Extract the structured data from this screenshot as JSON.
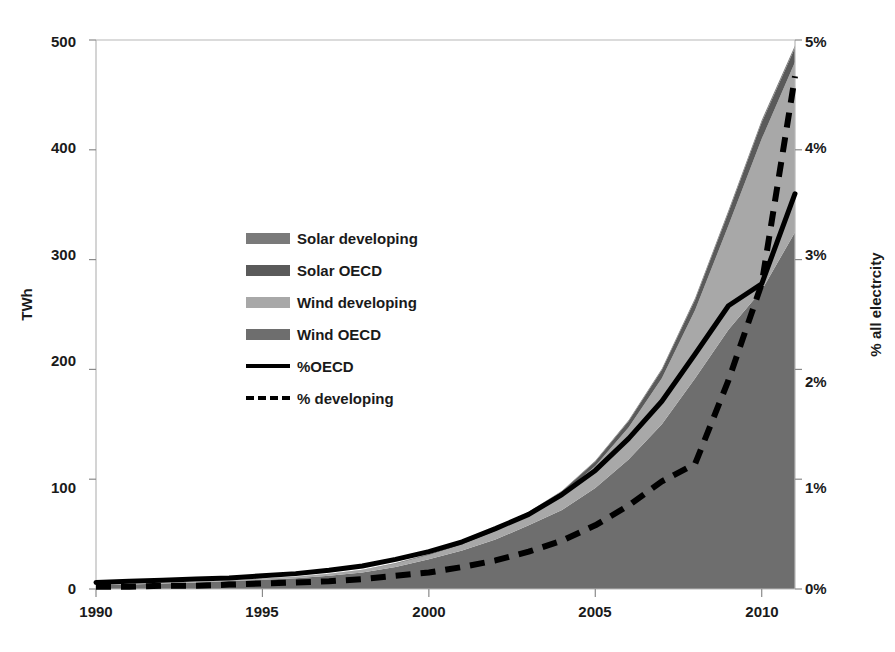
{
  "chart_data": {
    "type": "area",
    "title": "",
    "xlabel": "",
    "ylabel": "TWh",
    "ylabel_right": "% all electrcity",
    "xlim": [
      1990,
      2011
    ],
    "ylim": [
      0,
      500
    ],
    "ylim_right": [
      0,
      5
    ],
    "grid": false,
    "legend_position": "inside-upper-left",
    "x": [
      1990,
      1991,
      1992,
      1993,
      1994,
      1995,
      1996,
      1997,
      1998,
      1999,
      2000,
      2001,
      2002,
      2003,
      2004,
      2005,
      2006,
      2007,
      2008,
      2009,
      2010,
      2011
    ],
    "x_tick_labels": [
      "1990",
      "1995",
      "2000",
      "2005",
      "2010"
    ],
    "x_ticks": [
      1990,
      1995,
      2000,
      2005,
      2010
    ],
    "y_tick_labels": [
      "0",
      "100",
      "200",
      "300",
      "400",
      "500"
    ],
    "y_ticks": [
      0,
      100,
      200,
      300,
      400,
      500
    ],
    "y_right_tick_labels": [
      "0%",
      "1%",
      "2%",
      "3%",
      "4%",
      "5%"
    ],
    "y_right_ticks": [
      0,
      1,
      2,
      3,
      4,
      5
    ],
    "stack_order": [
      "Wind OECD",
      "Wind developing",
      "Solar OECD",
      "Solar developing"
    ],
    "series": [
      {
        "name": "Wind OECD",
        "type": "area-stacked",
        "axis": "left",
        "color": "#6e6e6e",
        "values": [
          3.5,
          4.2,
          5.0,
          6.0,
          7.2,
          8.5,
          9.8,
          12.0,
          15.0,
          20.0,
          27.0,
          35.0,
          45.0,
          58.0,
          72.0,
          92.0,
          118.0,
          150.0,
          192.0,
          236.0,
          272.0,
          325.0
        ]
      },
      {
        "name": "Wind developing",
        "type": "area-stacked",
        "axis": "left",
        "color": "#a8a8a8",
        "values": [
          0.2,
          0.3,
          0.4,
          0.5,
          0.7,
          0.9,
          1.2,
          1.6,
          2.2,
          3.0,
          4.0,
          5.5,
          7.5,
          10.0,
          14.0,
          20.0,
          29.0,
          42.0,
          62.0,
          95.0,
          138.0,
          155.0
        ]
      },
      {
        "name": "Solar OECD",
        "type": "area-stacked",
        "axis": "left",
        "color": "#5a5a5a",
        "values": [
          0.05,
          0.06,
          0.08,
          0.1,
          0.12,
          0.15,
          0.2,
          0.25,
          0.35,
          0.5,
          0.7,
          1.0,
          1.4,
          2.0,
          3.0,
          4.2,
          5.8,
          7.5,
          9.5,
          12.0,
          15.0,
          13.0
        ]
      },
      {
        "name": "Solar developing",
        "type": "area-stacked",
        "axis": "left",
        "color": "#7a7a7a",
        "values": [
          0.01,
          0.01,
          0.02,
          0.02,
          0.03,
          0.04,
          0.05,
          0.06,
          0.08,
          0.1,
          0.15,
          0.2,
          0.3,
          0.4,
          0.5,
          0.7,
          0.9,
          1.2,
          1.5,
          1.8,
          2.0,
          2.0
        ]
      },
      {
        "name": "%OECD",
        "type": "line",
        "axis": "right",
        "color": "#000000",
        "style": "solid",
        "values": [
          0.06,
          0.07,
          0.08,
          0.09,
          0.1,
          0.12,
          0.14,
          0.17,
          0.21,
          0.27,
          0.34,
          0.43,
          0.55,
          0.68,
          0.86,
          1.08,
          1.37,
          1.71,
          2.14,
          2.58,
          2.78,
          3.6
        ]
      },
      {
        "name": "% developing",
        "type": "line",
        "axis": "right",
        "color": "#000000",
        "style": "dashed",
        "values": [
          0.02,
          0.02,
          0.03,
          0.03,
          0.04,
          0.05,
          0.06,
          0.07,
          0.09,
          0.12,
          0.15,
          0.2,
          0.26,
          0.34,
          0.44,
          0.58,
          0.76,
          0.98,
          1.14,
          1.9,
          2.78,
          4.67
        ]
      }
    ]
  },
  "axes": {
    "left_title": "TWh",
    "right_title": "% all electrcity",
    "left_ticks": [
      "500",
      "400",
      "300",
      "200",
      "100",
      "0"
    ],
    "right_ticks": [
      "5%",
      "4%",
      "3%",
      "2%",
      "1%",
      "0%"
    ],
    "x_ticks": [
      "1990",
      "1995",
      "2000",
      "2005",
      "2010"
    ]
  },
  "legend": {
    "items": [
      {
        "label": "Solar developing",
        "marker": "swatch",
        "color": "#7a7a7a"
      },
      {
        "label": "Solar OECD",
        "marker": "swatch",
        "color": "#5a5a5a"
      },
      {
        "label": "Wind developing",
        "marker": "swatch",
        "color": "#a8a8a8"
      },
      {
        "label": "Wind OECD",
        "marker": "swatch",
        "color": "#6e6e6e"
      },
      {
        "label": "%OECD",
        "marker": "line-solid",
        "color": "#000000"
      },
      {
        "label": "% developing",
        "marker": "line-dashed",
        "color": "#000000"
      }
    ]
  }
}
